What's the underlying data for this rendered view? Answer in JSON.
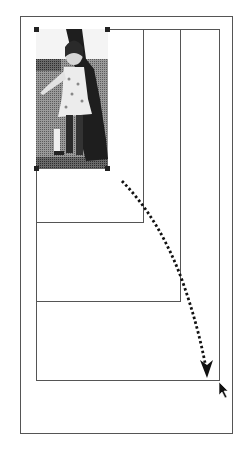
{
  "diagram": {
    "page": {
      "x": 20,
      "y": 16,
      "w": 213,
      "h": 418
    },
    "frames": [
      {
        "name": "frame-original",
        "x": 36,
        "y": 29,
        "w": 108,
        "h": 194
      },
      {
        "name": "frame-step-2",
        "x": 36,
        "y": 29,
        "w": 145,
        "h": 273
      },
      {
        "name": "frame-final",
        "x": 36,
        "y": 29,
        "w": 184,
        "h": 352
      }
    ],
    "photo": {
      "x": 36,
      "y": 29,
      "w": 72,
      "h": 140,
      "subject": "child in a dress walking on grass (grayscale halftone)"
    },
    "colors": {
      "line": "#555555",
      "handle": "#222222",
      "arrow": "#111111"
    }
  }
}
